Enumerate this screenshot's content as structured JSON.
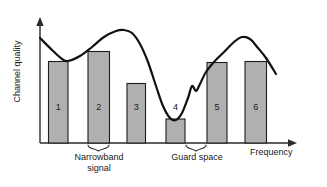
{
  "figure": {
    "title": "",
    "axes": {
      "y_label": "Channel quality",
      "x_label": "Frequency"
    },
    "annotations": {
      "narrowband_line1": "Narrowband",
      "narrowband_line2": "signal",
      "guard_space": "Guard space"
    },
    "colors": {
      "bar_fill": "#b0b0b0",
      "bar_stroke": "#1e1e1e",
      "curve": "#111111",
      "axis": "#2b2b2b",
      "background": "#ffffff"
    }
  },
  "chart_data": {
    "type": "bar",
    "title": "",
    "xlabel": "Frequency",
    "ylabel": "Channel quality",
    "grid": false,
    "legend": false,
    "axis_ticks": false,
    "categories": [
      "1",
      "2",
      "3",
      "4",
      "5",
      "6"
    ],
    "values": [
      82,
      92,
      60,
      24,
      81,
      82
    ],
    "ylim": [
      0,
      115
    ],
    "xlim": [
      0,
      260
    ],
    "bars": [
      {
        "label": "1",
        "x_left": 48.5,
        "x_right": 68.0,
        "top_y": 61.5,
        "value": 82
      },
      {
        "label": "2",
        "x_left": 88.0,
        "x_right": 109.5,
        "top_y": 51.5,
        "value": 92
      },
      {
        "label": "3",
        "x_left": 127.0,
        "x_right": 145.5,
        "top_y": 83.5,
        "value": 60
      },
      {
        "label": "4",
        "x_left": 166.0,
        "x_right": 185.0,
        "top_y": 119.0,
        "value": 24
      },
      {
        "label": "5",
        "x_left": 207.0,
        "x_right": 227.0,
        "top_y": 62.5,
        "value": 81
      },
      {
        "label": "6",
        "x_left": 245.0,
        "x_right": 266.5,
        "top_y": 61.5,
        "value": 82
      }
    ],
    "series": [
      {
        "name": "Channel quality",
        "type": "line",
        "points": [
          [
            40,
            38
          ],
          [
            52,
            50
          ],
          [
            62,
            59
          ],
          [
            68,
            61
          ],
          [
            80,
            56
          ],
          [
            92,
            47
          ],
          [
            104,
            37
          ],
          [
            116,
            31
          ],
          [
            124,
            30
          ],
          [
            132,
            33
          ],
          [
            140,
            44
          ],
          [
            148,
            62
          ],
          [
            156,
            86
          ],
          [
            163,
            106
          ],
          [
            170,
            118
          ],
          [
            176,
            120
          ],
          [
            182,
            113
          ],
          [
            188,
            98
          ],
          [
            192,
            86
          ],
          [
            196,
            91
          ],
          [
            200,
            84
          ],
          [
            206,
            72
          ],
          [
            214,
            62
          ],
          [
            224,
            52
          ],
          [
            234,
            42
          ],
          [
            242,
            37
          ],
          [
            250,
            39
          ],
          [
            258,
            48
          ],
          [
            266,
            58
          ],
          [
            276,
            74
          ]
        ]
      }
    ],
    "braces": [
      {
        "name": "narrowband-signal",
        "x_start": 88,
        "x_end": 109,
        "y": 145,
        "label": "Narrowband signal"
      },
      {
        "name": "guard-space",
        "x_start": 186,
        "x_end": 206,
        "y": 145,
        "label": "Guard space"
      }
    ]
  }
}
